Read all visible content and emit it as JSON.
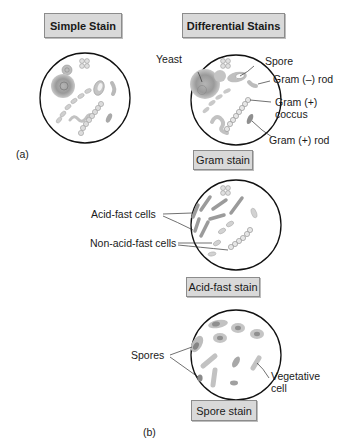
{
  "headers": {
    "simple": "Simple Stain",
    "differential": "Differential Stains"
  },
  "parts": {
    "a": "(a)",
    "b": "(b)"
  },
  "gram": {
    "caption": "Gram stain",
    "labels": {
      "yeast": "Yeast",
      "spore": "Spore",
      "gram_neg_rod": "Gram (–) rod",
      "gram_pos_coccus_1": "Gram (+)",
      "gram_pos_coccus_2": "coccus",
      "gram_pos_rod": "Gram (+) rod"
    }
  },
  "acid_fast": {
    "caption": "Acid-fast stain",
    "labels": {
      "acid_fast_cells": "Acid-fast cells",
      "non_acid_fast_cells": "Non-acid-fast cells"
    }
  },
  "spore_stain": {
    "caption": "Spore stain",
    "labels": {
      "spores": "Spores",
      "vegetative_1": "Vegetative",
      "vegetative_2": "cell"
    }
  },
  "colors": {
    "box_fill": "#d9d9d9",
    "box_border": "#8c8c8c",
    "cell_light": "#c8c8c8",
    "cell_mid": "#a8a8a8",
    "cell_dark": "#8a8a8a",
    "outline": "#111111"
  }
}
